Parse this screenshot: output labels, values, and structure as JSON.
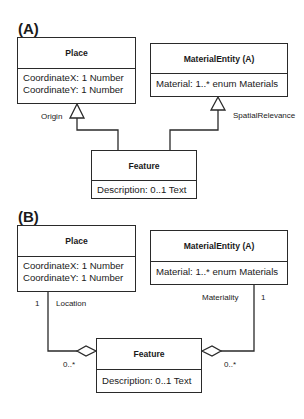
{
  "panels": [
    {
      "label": "(A)",
      "place": {
        "name": "Place",
        "attributes": [
          "CoordinateX: 1 Number",
          "CoordinateY: 1 Number"
        ]
      },
      "material_entity": {
        "name": "MaterialEntity (A)",
        "attributes": [
          "Material: 1..* enum Materials"
        ]
      },
      "feature": {
        "name": "Feature",
        "attributes": [
          "Description: 0..1 Text"
        ]
      },
      "relations": [
        {
          "type": "generalization",
          "from": "Feature",
          "to": "Place",
          "label": "Origin"
        },
        {
          "type": "generalization",
          "from": "Feature",
          "to": "MaterialEntity (A)",
          "label": "SpatialRelevance"
        }
      ]
    },
    {
      "label": "(B)",
      "place": {
        "name": "Place",
        "attributes": [
          "CoordinateX: 1 Number",
          "CoordinateY: 1 Number"
        ]
      },
      "material_entity": {
        "name": "MaterialEntity (A)",
        "attributes": [
          "Material: 1..* enum Materials"
        ]
      },
      "feature": {
        "name": "Feature",
        "attributes": [
          "Description: 0..1 Text"
        ]
      },
      "relations": [
        {
          "type": "aggregation",
          "from": "Feature",
          "to": "Place",
          "label": "Location",
          "mult_target": "1",
          "mult_source": "0..*"
        },
        {
          "type": "aggregation",
          "from": "Feature",
          "to": "MaterialEntity (A)",
          "label": "Materiality",
          "mult_target": "1",
          "mult_source": "0..*"
        }
      ]
    }
  ]
}
